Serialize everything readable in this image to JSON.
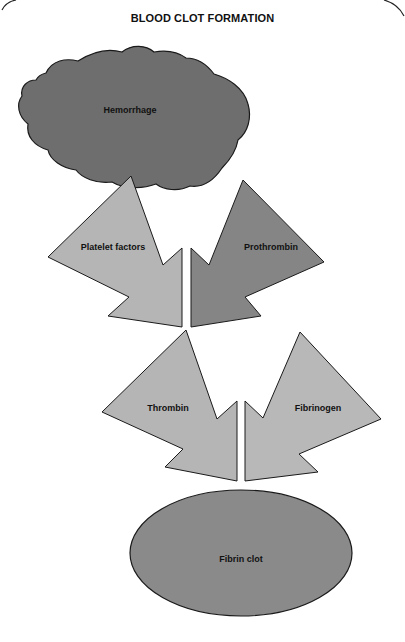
{
  "title": "BLOOD CLOT FORMATION",
  "colors": {
    "background": "#ffffff",
    "stroke": "#1a1a1a",
    "hemorrhage": "#6e6e6e",
    "platelet_factors": "#b5b5b5",
    "prothrombin": "#858585",
    "thrombin": "#b5b5b5",
    "fibrinogen": "#b8b8b8",
    "fibrin_clot": "#8a8a8a"
  },
  "nodes": {
    "hemorrhage": {
      "label": "Hemorrhage",
      "shape": "cloud"
    },
    "platelet_factors": {
      "label": "Platelet factors",
      "shape": "arrow"
    },
    "prothrombin": {
      "label": "Prothrombin",
      "shape": "arrow"
    },
    "thrombin": {
      "label": "Thrombin",
      "shape": "arrow"
    },
    "fibrinogen": {
      "label": "Fibrinogen",
      "shape": "arrow"
    },
    "fibrin_clot": {
      "label": "Fibrin clot",
      "shape": "ellipse"
    }
  },
  "flow": [
    [
      "Hemorrhage",
      "Platelet factors"
    ],
    [
      "Platelet factors",
      "Thrombin"
    ],
    [
      "Prothrombin",
      "Thrombin"
    ],
    [
      "Thrombin",
      "Fibrin clot"
    ],
    [
      "Fibrinogen",
      "Fibrin clot"
    ]
  ]
}
